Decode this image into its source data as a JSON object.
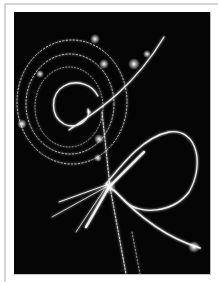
{
  "image": {
    "subject": "bubble-chamber particle tracks",
    "colors": {
      "background": "#050505",
      "track": "#f2f2f2",
      "frame": "#d4d4d4"
    }
  }
}
